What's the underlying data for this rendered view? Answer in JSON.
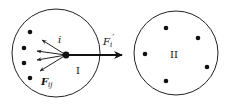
{
  "diagram": {
    "colors": {
      "stroke": "#222222",
      "dot": "#111111",
      "background": "#ffffff"
    },
    "systems": [
      {
        "id": "system-I",
        "label": "I",
        "center": [
          56,
          53
        ],
        "radius": 44,
        "particles": [
          [
            30,
            32
          ],
          [
            24,
            48
          ],
          [
            24,
            63
          ],
          [
            30,
            78
          ]
        ],
        "focus_particle": {
          "label": "i",
          "position": [
            66,
            55
          ]
        }
      },
      {
        "id": "system-II",
        "label": "II",
        "center": [
          176,
          53
        ],
        "radius": 42,
        "particles": [
          [
            166,
            28
          ],
          [
            198,
            38
          ],
          [
            145,
            54
          ],
          [
            207,
            67
          ],
          [
            166,
            81
          ]
        ]
      }
    ],
    "internal_forces": {
      "label_main": "F",
      "label_sub": "ij",
      "arrows_to": [
        [
          42,
          40
        ],
        [
          37,
          51
        ],
        [
          37,
          60
        ],
        [
          40,
          71
        ]
      ]
    },
    "external_force": {
      "label_main": "F",
      "label_sub": "i",
      "label_prime": "′",
      "from": [
        66,
        55
      ],
      "to": [
        122,
        55
      ]
    }
  }
}
